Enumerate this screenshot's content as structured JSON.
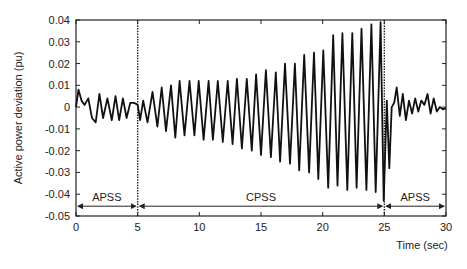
{
  "chart_data": {
    "type": "line",
    "title": "",
    "xlabel": "Time (sec)",
    "ylabel": "Active power deviation (pu)",
    "xlim": [
      0,
      30
    ],
    "ylim": [
      -0.05,
      0.04
    ],
    "xticks": [
      0,
      5,
      10,
      15,
      20,
      25,
      30
    ],
    "xtick_labels": [
      "0",
      "5",
      "10",
      "15",
      "20",
      "25",
      "30"
    ],
    "yticks": [
      0.04,
      0.03,
      0.02,
      0.01,
      0,
      -0.01,
      -0.02,
      -0.03,
      -0.04,
      -0.05
    ],
    "ytick_labels": [
      "0.04",
      "0.03",
      "0.02",
      "0.01",
      "0",
      "-0.01",
      "-0.02",
      "-0.03",
      "-0.04",
      "-0.05"
    ],
    "grid": false,
    "vertical_markers": [
      5,
      25
    ],
    "regions": [
      {
        "label": "APSS",
        "start": 0,
        "end": 5
      },
      {
        "label": "CPSS",
        "start": 5,
        "end": 25
      },
      {
        "label": "APSS",
        "start": 25,
        "end": 30
      }
    ],
    "series": [
      {
        "name": "Active power deviation",
        "x": [
          0,
          0.2,
          0.45,
          0.7,
          1.0,
          1.3,
          1.6,
          1.9,
          2.2,
          2.55,
          2.9,
          3.2,
          3.5,
          3.8,
          4.1,
          4.4,
          4.7,
          5.0,
          5.2,
          5.45,
          5.8,
          6.2,
          6.6,
          6.95,
          7.3,
          7.7,
          8.05,
          8.4,
          8.8,
          9.2,
          9.6,
          9.95,
          10.35,
          10.75,
          11.1,
          11.5,
          11.9,
          12.3,
          12.7,
          13.05,
          13.45,
          13.85,
          14.25,
          14.6,
          15.0,
          15.4,
          15.8,
          16.2,
          16.55,
          16.95,
          17.35,
          17.75,
          18.1,
          18.5,
          18.9,
          19.3,
          19.65,
          20.05,
          20.45,
          20.85,
          21.2,
          21.6,
          22.0,
          22.4,
          22.75,
          23.15,
          23.55,
          23.95,
          24.3,
          24.7,
          24.95,
          25.2,
          25.4,
          25.6,
          25.8,
          26.0,
          26.25,
          26.5,
          26.75,
          27.0,
          27.25,
          27.5,
          27.75,
          28.0,
          28.25,
          28.5,
          28.75,
          29.0,
          29.25,
          29.5,
          29.75,
          30.0
        ],
        "y": [
          0,
          0.008,
          0.003,
          0.001,
          0.004,
          -0.005,
          -0.007,
          0.006,
          -0.005,
          0.004,
          -0.006,
          0.005,
          -0.006,
          0.004,
          -0.005,
          0.002,
          0.002,
          0.001,
          -0.006,
          0.003,
          -0.007,
          0.007,
          -0.009,
          0.009,
          -0.011,
          0.01,
          -0.014,
          0.012,
          -0.013,
          0.012,
          -0.013,
          0.012,
          -0.015,
          0.012,
          -0.015,
          0.012,
          -0.016,
          0.012,
          -0.017,
          0.013,
          -0.019,
          0.013,
          -0.02,
          0.015,
          -0.022,
          0.017,
          -0.023,
          0.016,
          -0.025,
          0.02,
          -0.026,
          0.02,
          -0.029,
          0.024,
          -0.03,
          0.025,
          -0.033,
          0.026,
          -0.037,
          0.033,
          -0.036,
          0.034,
          -0.038,
          0.034,
          -0.037,
          0.036,
          -0.038,
          0.038,
          -0.039,
          0.039,
          -0.043,
          0.003,
          -0.028,
          0.0,
          0.002,
          0.009,
          -0.004,
          0.006,
          -0.006,
          0.003,
          -0.003,
          0.004,
          -0.002,
          0.003,
          0.001,
          0.006,
          -0.003,
          0.004,
          -0.002,
          0.0,
          -0.001,
          -0.0005
        ]
      }
    ]
  }
}
